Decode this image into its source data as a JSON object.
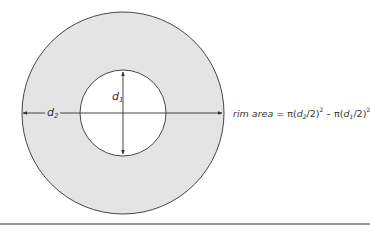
{
  "diagram": {
    "colors": {
      "ring_fill": "#e4e4e4",
      "stroke": "#333333",
      "inner_fill": "#ffffff",
      "rule": "#9a9a9a"
    },
    "geometry": {
      "center_x": 123,
      "center_y": 113,
      "outer_radius": 101,
      "inner_radius": 43
    },
    "labels": {
      "d1": {
        "base": "d",
        "sub": "1"
      },
      "d2": {
        "base": "d",
        "sub": "2"
      }
    },
    "formula": {
      "lhs": "rim area",
      "eq": " = ",
      "pi": "π",
      "term1_open": "(",
      "term1_var": "d",
      "term1_sub": "2",
      "term1_rest": "/2)",
      "term1_sup": "2",
      "minus": " – ",
      "term2_open": "(",
      "term2_var": "d",
      "term2_sub": "1",
      "term2_rest": "/2)",
      "term2_sup": "2"
    }
  }
}
